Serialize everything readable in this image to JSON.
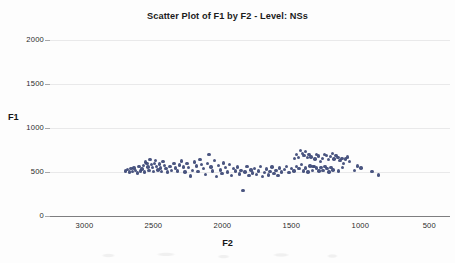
{
  "chart_data": {
    "type": "scatter",
    "title": "Scatter Plot of F1 by F2 - Level: NSs",
    "xlabel": "F2",
    "ylabel": "F1",
    "xlim": [
      3250,
      350
    ],
    "ylim": [
      2000,
      0
    ],
    "x_inverted": true,
    "y_inverted": true,
    "grid": true,
    "legend": null,
    "xticks": [
      3000,
      2500,
      2000,
      1500,
      1000,
      500
    ],
    "yticks": [
      0,
      500,
      1000,
      1500,
      2000
    ],
    "xticklabels": [
      "3000",
      "2500",
      "2000",
      "1500",
      "1000",
      "500"
    ],
    "yticklabels": [
      "0",
      "500",
      "1000",
      "1500",
      "2000"
    ],
    "marker_color": "#3b4675",
    "marker_size": 3.4,
    "series": [
      {
        "name": "NSs",
        "points": [
          [
            2703,
            512
          ],
          [
            2688,
            528
          ],
          [
            2672,
            498
          ],
          [
            2664,
            540
          ],
          [
            2650,
            505
          ],
          [
            2640,
            545
          ],
          [
            2628,
            520
          ],
          [
            2616,
            487
          ],
          [
            2604,
            560
          ],
          [
            2596,
            510
          ],
          [
            2584,
            532
          ],
          [
            2572,
            575
          ],
          [
            2566,
            500
          ],
          [
            2556,
            612
          ],
          [
            2548,
            598
          ],
          [
            2540,
            556
          ],
          [
            2532,
            520
          ],
          [
            2524,
            640
          ],
          [
            2516,
            585
          ],
          [
            2508,
            548
          ],
          [
            2500,
            508
          ],
          [
            2492,
            596
          ],
          [
            2484,
            630
          ],
          [
            2476,
            562
          ],
          [
            2468,
            524
          ],
          [
            2458,
            590
          ],
          [
            2448,
            546
          ],
          [
            2440,
            505
          ],
          [
            2430,
            618
          ],
          [
            2420,
            575
          ],
          [
            2410,
            538
          ],
          [
            2400,
            500
          ],
          [
            2380,
            560
          ],
          [
            2368,
            520
          ],
          [
            2352,
            600
          ],
          [
            2340,
            545
          ],
          [
            2326,
            512
          ],
          [
            2310,
            580
          ],
          [
            2296,
            624
          ],
          [
            2284,
            556
          ],
          [
            2270,
            500
          ],
          [
            2258,
            596
          ],
          [
            2244,
            548
          ],
          [
            2230,
            455
          ],
          [
            2216,
            520
          ],
          [
            2204,
            612
          ],
          [
            2190,
            570
          ],
          [
            2176,
            508
          ],
          [
            2162,
            640
          ],
          [
            2150,
            588
          ],
          [
            2136,
            540
          ],
          [
            2124,
            470
          ],
          [
            2110,
            596
          ],
          [
            2096,
            700
          ],
          [
            2084,
            556
          ],
          [
            2070,
            512
          ],
          [
            2056,
            630
          ],
          [
            2044,
            448
          ],
          [
            2030,
            572
          ],
          [
            2016,
            524
          ],
          [
            2002,
            486
          ],
          [
            1990,
            604
          ],
          [
            1976,
            548
          ],
          [
            1962,
            500
          ],
          [
            1948,
            586
          ],
          [
            1934,
            462
          ],
          [
            1920,
            540
          ],
          [
            1906,
            512
          ],
          [
            1892,
            556
          ],
          [
            1878,
            478
          ],
          [
            1864,
            520
          ],
          [
            1850,
            290
          ],
          [
            1836,
            498
          ],
          [
            1822,
            566
          ],
          [
            1808,
            462
          ],
          [
            1794,
            524
          ],
          [
            1780,
            488
          ],
          [
            1766,
            540
          ],
          [
            1752,
            470
          ],
          [
            1738,
            512
          ],
          [
            1724,
            560
          ],
          [
            1710,
            450
          ],
          [
            1696,
            496
          ],
          [
            1682,
            534
          ],
          [
            1668,
            468
          ],
          [
            1654,
            508
          ],
          [
            1640,
            555
          ],
          [
            1626,
            480
          ],
          [
            1612,
            520
          ],
          [
            1598,
            462
          ],
          [
            1584,
            544
          ],
          [
            1570,
            500
          ],
          [
            1552,
            528
          ],
          [
            1534,
            560
          ],
          [
            1516,
            494
          ],
          [
            1498,
            538
          ],
          [
            1480,
            512
          ],
          [
            1462,
            566
          ],
          [
            1444,
            540
          ],
          [
            1426,
            588
          ],
          [
            1410,
            510
          ],
          [
            1396,
            545
          ],
          [
            1380,
            500
          ],
          [
            1364,
            570
          ],
          [
            1348,
            520
          ],
          [
            1332,
            560
          ],
          [
            1318,
            544
          ],
          [
            1300,
            510
          ],
          [
            1284,
            552
          ],
          [
            1270,
            520
          ],
          [
            1256,
            566
          ],
          [
            1242,
            540
          ],
          [
            1228,
            500
          ],
          [
            1214,
            548
          ],
          [
            1198,
            525
          ],
          [
            1478,
            652
          ],
          [
            1462,
            700
          ],
          [
            1448,
            668
          ],
          [
            1434,
            742
          ],
          [
            1420,
            712
          ],
          [
            1408,
            690
          ],
          [
            1396,
            736
          ],
          [
            1384,
            665
          ],
          [
            1372,
            700
          ],
          [
            1358,
            672
          ],
          [
            1344,
            560
          ],
          [
            1330,
            648
          ],
          [
            1316,
            700
          ],
          [
            1302,
            680
          ],
          [
            1288,
            618
          ],
          [
            1274,
            655
          ],
          [
            1260,
            702
          ],
          [
            1246,
            688
          ],
          [
            1232,
            640
          ],
          [
            1218,
            676
          ],
          [
            1204,
            712
          ],
          [
            1190,
            650
          ],
          [
            1176,
            690
          ],
          [
            1162,
            668
          ],
          [
            1148,
            628
          ],
          [
            1134,
            655
          ],
          [
            1120,
            600
          ],
          [
            1106,
            648
          ],
          [
            1092,
            672
          ],
          [
            1078,
            620
          ],
          [
            1044,
            520
          ],
          [
            1020,
            568
          ],
          [
            996,
            544
          ],
          [
            1160,
            512
          ],
          [
            1128,
            548
          ],
          [
            916,
            505
          ],
          [
            868,
            466
          ]
        ]
      }
    ]
  },
  "axes": {
    "y_title": "F1",
    "x_title": "F2"
  }
}
